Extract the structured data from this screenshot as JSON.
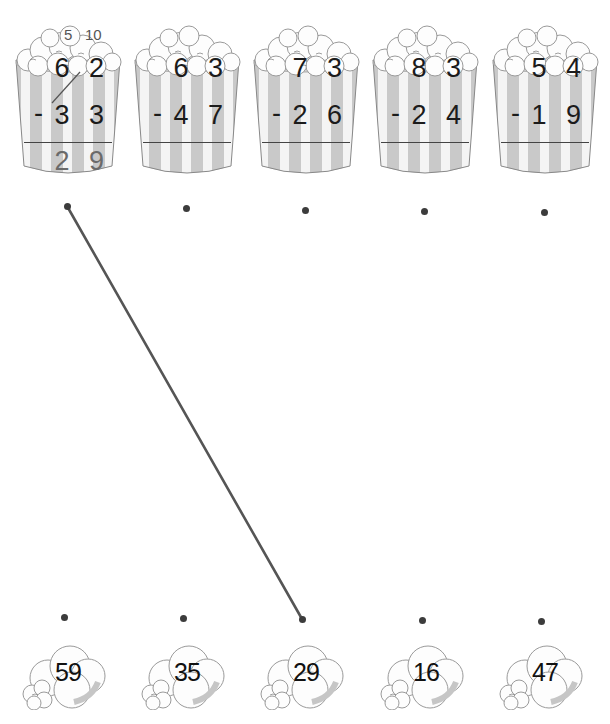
{
  "worksheet": {
    "instructions_visible": false,
    "problems": [
      {
        "id": "p1",
        "minuend": "6 2",
        "subtrahend": "3 3",
        "operator": "-",
        "answer": "2 9",
        "borrow_marks": {
          "tens": "5",
          "ones": "10"
        },
        "x": 8
      },
      {
        "id": "p2",
        "minuend": "6 3",
        "subtrahend": "4 7",
        "operator": "-",
        "answer": "",
        "x": 127
      },
      {
        "id": "p3",
        "minuend": "7 3",
        "subtrahend": "2 6",
        "operator": "-",
        "answer": "",
        "x": 246
      },
      {
        "id": "p4",
        "minuend": "8 3",
        "subtrahend": "2 4",
        "operator": "-",
        "answer": "",
        "x": 365
      },
      {
        "id": "p5",
        "minuend": "5 4",
        "subtrahend": "1 9",
        "operator": "-",
        "answer": "",
        "x": 485
      }
    ],
    "answer_choices": [
      {
        "value": "59",
        "x": 14
      },
      {
        "value": "35",
        "x": 133
      },
      {
        "value": "29",
        "x": 252
      },
      {
        "value": "16",
        "x": 372
      },
      {
        "value": "47",
        "x": 491
      }
    ],
    "top_dots": [
      [
        67,
        206
      ],
      [
        186,
        208
      ],
      [
        305,
        210
      ],
      [
        424,
        211
      ],
      [
        544,
        212
      ]
    ],
    "bottom_dots": [
      [
        64,
        617
      ],
      [
        183,
        618
      ],
      [
        302,
        619
      ],
      [
        422,
        620
      ],
      [
        541,
        621
      ]
    ],
    "connections": [
      {
        "from_problem": "p1",
        "to_answer": "29",
        "x1": 67,
        "y1": 206,
        "x2": 302,
        "y2": 619
      }
    ],
    "colors": {
      "ink": "#1b1b1b",
      "answer_ink": "#6a6a6a",
      "line": "#555555",
      "stripe_gray": "#c9c9c9",
      "stripe_white": "#f4f4f4",
      "dot": "#3c3c3c"
    }
  }
}
